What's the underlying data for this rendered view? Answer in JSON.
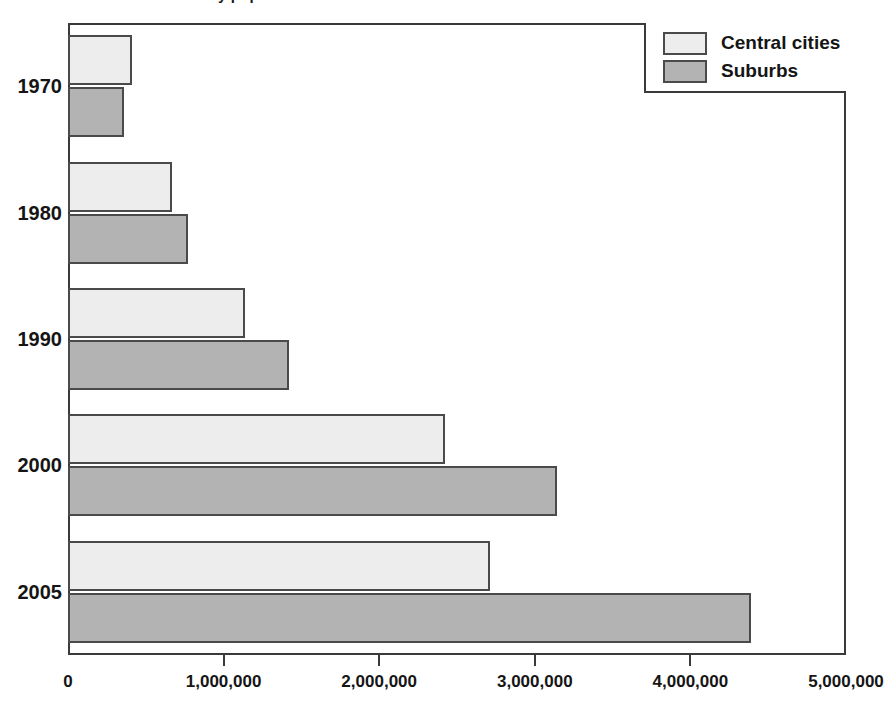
{
  "figure": {
    "clipped_title": "Poverty populations in central cities and suburbs",
    "background_color": "#ffffff"
  },
  "legend": {
    "position": "top-right",
    "entries": [
      {
        "label": "Central cities",
        "color": "#ededed",
        "swatch_name": "legend-swatch-central-cities"
      },
      {
        "label": "Suburbs",
        "color": "#b3b3b3",
        "swatch_name": "legend-swatch-suburbs"
      }
    ]
  },
  "axes": {
    "x": {
      "min": 0,
      "max": 5000000,
      "step": 1000000,
      "tick_labels": [
        "0",
        "1,000,000",
        "2,000,000",
        "3,000,000",
        "4,000,000",
        "5,000,000"
      ],
      "tick_values": [
        0,
        1000000,
        2000000,
        3000000,
        4000000,
        5000000
      ],
      "label": ""
    },
    "y": {
      "categories": [
        "1970",
        "1980",
        "1990",
        "2000",
        "2005"
      ],
      "label": ""
    }
  },
  "chart_data": {
    "type": "bar",
    "orientation": "horizontal",
    "title": "Poverty populations in central cities and suburbs",
    "xlabel": "",
    "ylabel": "",
    "xlim": [
      0,
      5000000
    ],
    "grid": false,
    "legend_position": "top-right",
    "categories": [
      "1970",
      "1980",
      "1990",
      "2000",
      "2005"
    ],
    "series": [
      {
        "name": "Central cities",
        "color": "#ededed",
        "values": [
          410000,
          670000,
          1140000,
          2420000,
          2710000
        ]
      },
      {
        "name": "Suburbs",
        "color": "#b3b3b3",
        "values": [
          360000,
          770000,
          1420000,
          3140000,
          4390000
        ]
      }
    ]
  },
  "colors": {
    "central_cities": "#ededed",
    "suburbs": "#b3b3b3",
    "outline": "#4a4a4a",
    "frame": "#3a3a3a",
    "text": "#151515"
  }
}
